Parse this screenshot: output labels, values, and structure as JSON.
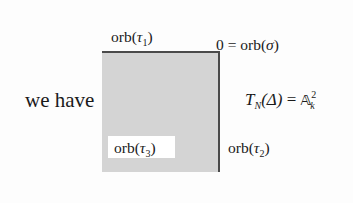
{
  "text": {
    "lead": "we have",
    "formula": {
      "lhs_symbol": "T",
      "lhs_sub": "N",
      "lhs_arg": "(Δ)",
      "equals": "=",
      "rhs_symbol": "𝔸",
      "rhs_sup": "2",
      "rhs_sub": "k"
    }
  },
  "diagram": {
    "shape": "shaded square (fan cone)",
    "fill_color": "#d4d4d4",
    "edge_color": "#4a4a4a",
    "labels": {
      "tau1": {
        "prefix": "orb(",
        "symbol": "τ",
        "sub": "1",
        "suffix": ")"
      },
      "sigma": {
        "prefix": "0 = orb(",
        "symbol": "σ",
        "suffix": ")"
      },
      "tau2": {
        "prefix": "orb(",
        "symbol": "τ",
        "sub": "2",
        "suffix": ")"
      },
      "tau3": {
        "prefix": "orb(",
        "symbol": "τ",
        "sub": "3",
        "suffix": ")"
      }
    }
  }
}
